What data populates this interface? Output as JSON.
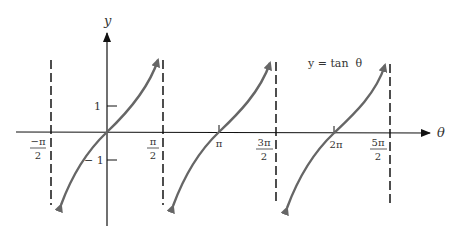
{
  "diagram": {
    "title_label": "y = tan  θ",
    "axes": {
      "x_label": "θ",
      "y_label": "y"
    },
    "y_ticks": [
      {
        "value": 1,
        "label": "1"
      },
      {
        "value": -1,
        "label": "− 1"
      }
    ],
    "x_ticks": [
      {
        "value": "-π/2",
        "num": "−π",
        "den": "2",
        "asymptote": true
      },
      {
        "value": "π/2",
        "num": "π",
        "den": "2",
        "asymptote": true
      },
      {
        "value": "π",
        "label": "π",
        "asymptote": false
      },
      {
        "value": "3π/2",
        "num": "3π",
        "den": "2",
        "asymptote": true
      },
      {
        "value": "2π",
        "label": "2π",
        "asymptote": false
      },
      {
        "value": "5π/2",
        "num": "5π",
        "den": "2",
        "asymptote": true
      }
    ],
    "branches": [
      {
        "center": "0",
        "interval": "(-π/2, π/2)"
      },
      {
        "center": "π",
        "interval": "(π/2, 3π/2)"
      },
      {
        "center": "2π",
        "interval": "(3π/2, 5π/2)"
      }
    ],
    "colors": {
      "axis": "#111111",
      "curve": "#666666",
      "asymptote": "#222222",
      "text": "#333333"
    }
  }
}
